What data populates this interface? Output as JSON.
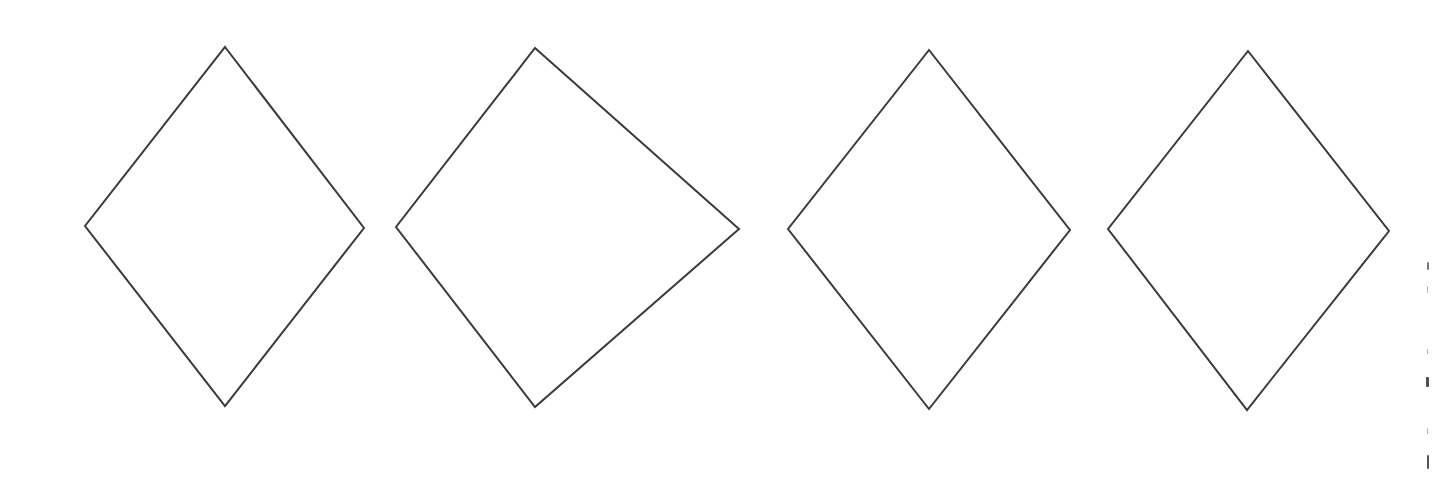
{
  "figure": {
    "background": "#ffffff",
    "stroke_color": "#3a3a3a",
    "stroke_width": 2,
    "shapes": [
      {
        "name": "rhombus-1",
        "type": "rhombus",
        "vertices": {
          "top": [
            225,
            47
          ],
          "right": [
            364,
            228
          ],
          "bottom": [
            225,
            406
          ],
          "left": [
            85,
            226
          ]
        }
      },
      {
        "name": "kite-2",
        "type": "kite",
        "vertices": {
          "top": [
            535,
            48
          ],
          "right": [
            739,
            229
          ],
          "bottom": [
            535,
            407
          ],
          "left": [
            396,
            227
          ]
        }
      },
      {
        "name": "rhombus-3",
        "type": "rhombus",
        "vertices": {
          "top": [
            929,
            50
          ],
          "right": [
            1070,
            230
          ],
          "bottom": [
            929,
            409
          ],
          "left": [
            788,
            229
          ]
        }
      },
      {
        "name": "rhombus-4",
        "type": "rhombus",
        "vertices": {
          "top": [
            1248,
            51
          ],
          "right": [
            1389,
            231
          ],
          "bottom": [
            1247,
            410
          ],
          "left": [
            1108,
            229
          ]
        }
      }
    ]
  }
}
